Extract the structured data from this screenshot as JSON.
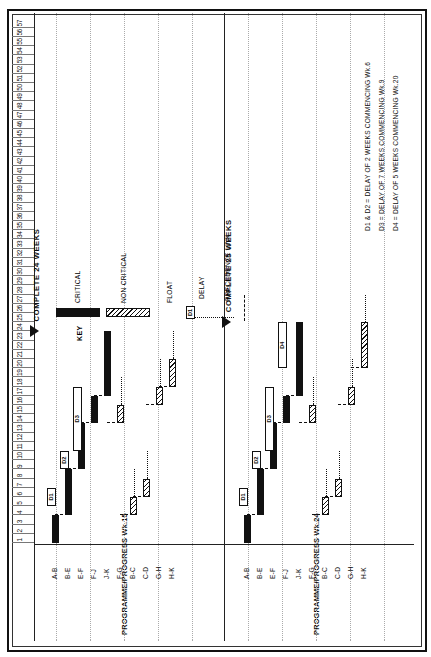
{
  "document": {
    "type": "construction-programme-bar-chart",
    "orientation": "landscape-rotated-90"
  },
  "axis": {
    "label": "WEEKS",
    "ticks": [
      1,
      2,
      3,
      4,
      5,
      6,
      7,
      8,
      9,
      10,
      11,
      12,
      13,
      14,
      15,
      16,
      17,
      18,
      19,
      20,
      21,
      22,
      23,
      24,
      25,
      26,
      27,
      28,
      29,
      30,
      31,
      32,
      33,
      34,
      35,
      36,
      37,
      38,
      39,
      40,
      41,
      42,
      43,
      44,
      45,
      46,
      47,
      48,
      49,
      50,
      51,
      52,
      53,
      54,
      55,
      56,
      57
    ],
    "min": 1,
    "max": 57
  },
  "blocks": [
    {
      "id": "block-1",
      "title": "PROGRAMME/PROGRESS Wk.15",
      "milestone_text": "COMPLETE 24 WEEKS",
      "milestone_week": 24,
      "activities": [
        {
          "label": "A-B",
          "type": "critical",
          "start": 1,
          "end": 4
        },
        {
          "label": "B-E",
          "type": "critical",
          "start": 4,
          "end": 9
        },
        {
          "label": "E-F",
          "type": "critical",
          "start": 9,
          "end": 14
        },
        {
          "label": "F-J",
          "type": "critical",
          "start": 14,
          "end": 17
        },
        {
          "label": "J-K",
          "type": "critical",
          "start": 17,
          "end": 24
        },
        {
          "label": "F-G",
          "type": "non-critical",
          "start": 14,
          "end": 16
        },
        {
          "label": "B-C",
          "type": "non-critical",
          "start": 4,
          "end": 6
        },
        {
          "label": "C-D",
          "type": "non-critical",
          "start": 6,
          "end": 8
        },
        {
          "label": "G-H",
          "type": "non-critical",
          "start": 16,
          "end": 18
        },
        {
          "label": "H-K",
          "type": "non-critical",
          "start": 18,
          "end": 21
        }
      ],
      "delays": [
        {
          "label": "D1",
          "start": 5,
          "end": 7
        },
        {
          "label": "D2",
          "start": 9,
          "end": 11
        },
        {
          "label": "D3",
          "start": 11,
          "end": 18
        }
      ]
    },
    {
      "id": "block-2",
      "title": "PROGRAMME/PROGRESS Wk.24",
      "milestone_text": "COMPLETE 25 WEEKS",
      "milestone_week": 25,
      "activities": [
        {
          "label": "A-B",
          "type": "critical",
          "start": 1,
          "end": 4
        },
        {
          "label": "B-E",
          "type": "critical",
          "start": 4,
          "end": 9
        },
        {
          "label": "E-F",
          "type": "critical",
          "start": 9,
          "end": 14
        },
        {
          "label": "F-J",
          "type": "critical",
          "start": 14,
          "end": 17
        },
        {
          "label": "J-K",
          "type": "critical",
          "start": 17,
          "end": 25
        },
        {
          "label": "F-G",
          "type": "non-critical",
          "start": 14,
          "end": 16
        },
        {
          "label": "B-C",
          "type": "non-critical",
          "start": 4,
          "end": 6
        },
        {
          "label": "C-D",
          "type": "non-critical",
          "start": 6,
          "end": 8
        },
        {
          "label": "G-H",
          "type": "non-critical",
          "start": 16,
          "end": 18
        },
        {
          "label": "H-K",
          "type": "non-critical",
          "start": 20,
          "end": 25
        }
      ],
      "delays": [
        {
          "label": "D1",
          "start": 5,
          "end": 7
        },
        {
          "label": "D2",
          "start": 9,
          "end": 11
        },
        {
          "label": "D3",
          "start": 11,
          "end": 18
        },
        {
          "label": "D4",
          "start": 20,
          "end": 25
        }
      ]
    }
  ],
  "key": {
    "title": "KEY",
    "items": [
      {
        "swatch": "critical-bar-swatch",
        "label": "CRITICAL"
      },
      {
        "swatch": "non-critical-bar-swatch",
        "label": "NON CRITICAL"
      },
      {
        "swatch": "float-line-swatch",
        "label": "FLOAT"
      },
      {
        "swatch": "delay-box-swatch",
        "label": "DELAY",
        "box_text": "D1"
      },
      {
        "swatch": "precedence-link-swatch",
        "label": "PRECEDENCE LINK"
      }
    ]
  },
  "notes": [
    "D1 & D2 = DELAY OF 2 WEEKS COMMENCING Wk.6",
    "D3  =  DELAY OF 7 WEEKS COMMENCING Wk.9",
    "D4  =  DELAY OF 5 WEEKS COMMENCING Wk.20"
  ],
  "colors": {
    "ink": "#111111",
    "frame": "#222222",
    "guide": "#aaaaaa",
    "paper": "#ffffff"
  }
}
